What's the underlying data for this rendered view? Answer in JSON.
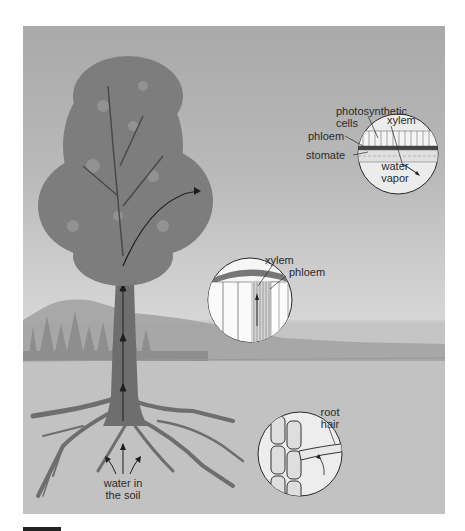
{
  "figure": {
    "type": "diagram",
    "colors": {
      "sky_top": "#a9a9a9",
      "sky_bottom": "#d6d6d6",
      "ground": "#c4c4c4",
      "foliage": "#7d7d7d",
      "trunk": "#6e6e6e",
      "outline": "#2a2a2a",
      "inset_fill": "#eeeeee"
    }
  },
  "labels": {
    "leaf_inset": {
      "photosynthetic_cells": "photosynthetic cells",
      "photosynthetic_line1": "photosynthetic",
      "photosynthetic_line2": "cells",
      "xylem": "xylem",
      "phloem": "phloem",
      "stomate": "stomate",
      "water_vapor_line1": "water",
      "water_vapor_line2": "vapor"
    },
    "trunk_inset": {
      "xylem": "xylem",
      "phloem": "phloem"
    },
    "root_inset": {
      "root_hair_line1": "root",
      "root_hair_line2": "hair"
    },
    "soil": {
      "water_in_soil_line1": "water in",
      "water_in_soil_line2": "the soil"
    }
  }
}
